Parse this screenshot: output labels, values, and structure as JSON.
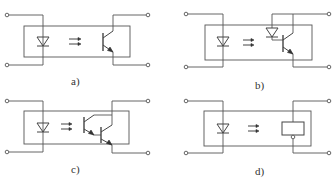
{
  "diagram": {
    "panels": [
      {
        "id": "a",
        "label": "a)",
        "input": "LED (photodiode emitter)",
        "output": "phototransistor"
      },
      {
        "id": "b",
        "label": "b)",
        "input": "LED (photodiode emitter)",
        "output": "photodiode + transistor"
      },
      {
        "id": "c",
        "label": "c)",
        "input": "LED (photodiode emitter)",
        "output": "Darlington phototransistor"
      },
      {
        "id": "d",
        "label": "d)",
        "input": "LED (photodiode emitter)",
        "output": "integrated circuit block"
      }
    ],
    "colors": {
      "line": "#555555",
      "background": "#ffffff"
    }
  }
}
